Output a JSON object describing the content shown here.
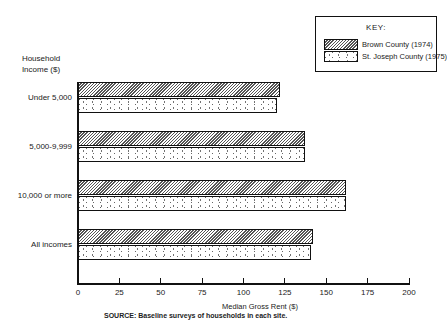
{
  "chart_data": {
    "type": "bar",
    "orientation": "horizontal",
    "title": "",
    "ylabel": "Household Income ($)",
    "xlabel": "Median Gross Rent ($)",
    "xlim": [
      0,
      200
    ],
    "xticks": [
      "0",
      "25",
      "50",
      "75",
      "100",
      "125",
      "150",
      "175",
      "200"
    ],
    "categories": [
      "Under 5,000",
      "5,000-9,999",
      "10,000 or more",
      "All incomes"
    ],
    "series": [
      {
        "name": "Brown County (1974)",
        "pattern": "hatched",
        "values": [
          122,
          137,
          162,
          142
        ]
      },
      {
        "name": "St. Joseph County (1975)",
        "pattern": "dotted",
        "values": [
          120,
          137,
          162,
          141
        ]
      }
    ],
    "legend": {
      "title": "KEY:",
      "position": "top-right"
    },
    "grid": false,
    "source": "SOURCE: Baseline surveys of households in each site."
  },
  "labels": {
    "ylabel_line1": "Household",
    "ylabel_line2": "Income ($)",
    "xlabel": "Median Gross Rent ($)",
    "source_prefix": "SOURCE:",
    "source_text": "Baseline surveys of households in each site.",
    "key_title": "KEY:",
    "key_item1": "Brown County (1974)",
    "key_item2": "St. Joseph County (1975)",
    "cat0": "Under 5,000",
    "cat1": "5,000-9,999",
    "cat2": "10,000 or more",
    "cat3": "All incomes",
    "t0": "0",
    "t1": "25",
    "t2": "50",
    "t3": "75",
    "t4": "100",
    "t5": "125",
    "t6": "150",
    "t7": "175",
    "t8": "200"
  }
}
